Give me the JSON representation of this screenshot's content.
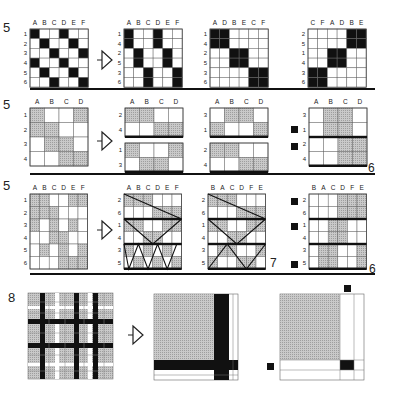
{
  "colors": {
    "black": "#111111",
    "hatch": "#bdbdbd",
    "hatch_line": "#9a9a9a",
    "grid_line": "#555555",
    "white": "#ffffff"
  },
  "sections": [
    {
      "number": "5",
      "panels": [
        {
          "id": "s1p1",
          "cols": [
            "A",
            "B",
            "C",
            "D",
            "E",
            "F"
          ],
          "rows": [
            "1",
            "2",
            "3",
            "4",
            "5",
            "6"
          ],
          "cells": [
            [
              2,
              0,
              0,
              2,
              0,
              0
            ],
            [
              0,
              2,
              0,
              0,
              2,
              0
            ],
            [
              0,
              0,
              2,
              0,
              0,
              2
            ],
            [
              2,
              0,
              0,
              2,
              0,
              0
            ],
            [
              0,
              2,
              0,
              0,
              2,
              0
            ],
            [
              0,
              0,
              2,
              0,
              0,
              2
            ]
          ]
        },
        {
          "id": "s1p2",
          "cols": [
            "A",
            "B",
            "C",
            "D",
            "E",
            "F"
          ],
          "rows": [
            "1",
            "4",
            "2",
            "5",
            "3",
            "6"
          ],
          "cells": [
            [
              2,
              0,
              0,
              2,
              0,
              0
            ],
            [
              2,
              0,
              0,
              2,
              0,
              0
            ],
            [
              0,
              2,
              0,
              0,
              2,
              0
            ],
            [
              0,
              2,
              0,
              0,
              2,
              0
            ],
            [
              0,
              0,
              2,
              0,
              0,
              2
            ],
            [
              0,
              0,
              2,
              0,
              0,
              2
            ]
          ]
        },
        {
          "id": "s1p3",
          "cols": [
            "A",
            "D",
            "B",
            "E",
            "C",
            "F"
          ],
          "rows": [
            "1",
            "4",
            "2",
            "5",
            "3",
            "6"
          ],
          "cells": [
            [
              2,
              2,
              0,
              0,
              0,
              0
            ],
            [
              2,
              2,
              0,
              0,
              0,
              0
            ],
            [
              0,
              0,
              2,
              2,
              0,
              0
            ],
            [
              0,
              0,
              2,
              2,
              0,
              0
            ],
            [
              0,
              0,
              0,
              0,
              2,
              2
            ],
            [
              0,
              0,
              0,
              0,
              2,
              2
            ]
          ]
        },
        {
          "id": "s1p4",
          "cols": [
            "C",
            "F",
            "A",
            "D",
            "B",
            "E"
          ],
          "rows": [
            "2",
            "5",
            "1",
            "4",
            "3",
            "6"
          ],
          "cells": [
            [
              0,
              0,
              0,
              0,
              2,
              2
            ],
            [
              0,
              0,
              0,
              0,
              2,
              2
            ],
            [
              0,
              0,
              2,
              2,
              0,
              0
            ],
            [
              0,
              0,
              2,
              2,
              0,
              0
            ],
            [
              2,
              2,
              0,
              0,
              0,
              0
            ],
            [
              2,
              2,
              0,
              0,
              0,
              0
            ]
          ]
        }
      ]
    },
    {
      "number": "5",
      "side_number": "6",
      "panels": [
        {
          "id": "s2p1",
          "cols": [
            "A",
            "B",
            "C",
            "D"
          ],
          "rows": [
            "1",
            "2",
            "3",
            "4"
          ],
          "cells": [
            [
              1,
              0,
              0,
              1
            ],
            [
              1,
              1,
              0,
              0
            ],
            [
              0,
              1,
              1,
              0
            ],
            [
              0,
              0,
              1,
              1
            ]
          ]
        },
        {
          "id": "s2p2a",
          "cols": [
            "A",
            "B",
            "C",
            "D"
          ],
          "rows": [
            "2",
            "4"
          ],
          "cells": [
            [
              1,
              1,
              0,
              0
            ],
            [
              0,
              0,
              1,
              1
            ]
          ]
        },
        {
          "id": "s2p2b",
          "cols": [],
          "rows": [
            "1",
            "3"
          ],
          "cells": [
            [
              1,
              0,
              0,
              1
            ],
            [
              0,
              1,
              1,
              0
            ]
          ]
        },
        {
          "id": "s2p3a",
          "cols": [
            "A",
            "B",
            "C",
            "D"
          ],
          "rows": [
            "3",
            "1"
          ],
          "cells": [
            [
              0,
              1,
              1,
              0
            ],
            [
              1,
              0,
              0,
              1
            ]
          ]
        },
        {
          "id": "s2p3b",
          "cols": [],
          "rows": [
            "2",
            "4"
          ],
          "cells": [
            [
              1,
              1,
              0,
              0
            ],
            [
              0,
              0,
              1,
              1
            ]
          ]
        },
        {
          "id": "s2p4",
          "cols": [
            "A",
            "B",
            "C",
            "D"
          ],
          "rows": [
            "3",
            "1",
            "2",
            "4"
          ],
          "cells": [
            [
              0,
              1,
              1,
              0
            ],
            [
              0,
              1,
              1,
              0
            ],
            [
              0,
              0,
              1,
              1
            ],
            [
              0,
              0,
              1,
              1
            ]
          ]
        }
      ]
    },
    {
      "number": "5",
      "side_number_a": "7",
      "side_number_b": "6",
      "panels": [
        {
          "id": "s3p1",
          "cols": [
            "A",
            "B",
            "C",
            "D",
            "E",
            "F"
          ],
          "rows": [
            "1",
            "2",
            "3",
            "4",
            "5",
            "6"
          ],
          "cells": [
            [
              1,
              1,
              0,
              0,
              1,
              1
            ],
            [
              1,
              1,
              1,
              0,
              0,
              0
            ],
            [
              1,
              0,
              1,
              0,
              1,
              0
            ],
            [
              0,
              0,
              1,
              1,
              0,
              0
            ],
            [
              0,
              1,
              0,
              1,
              0,
              1
            ],
            [
              0,
              0,
              0,
              1,
              1,
              1
            ]
          ]
        },
        {
          "id": "s3p2",
          "cols": [
            "A",
            "B",
            "C",
            "D",
            "E",
            "F"
          ],
          "rows": [
            "2",
            "6",
            "1",
            "4",
            "3",
            "5"
          ],
          "cells": [
            [
              1,
              1,
              1,
              0,
              0,
              0
            ],
            [
              0,
              0,
              0,
              1,
              1,
              1
            ],
            [
              1,
              1,
              0,
              0,
              1,
              1
            ],
            [
              0,
              0,
              1,
              1,
              0,
              0
            ],
            [
              1,
              0,
              1,
              0,
              1,
              0
            ],
            [
              0,
              1,
              0,
              1,
              0,
              1
            ]
          ]
        },
        {
          "id": "s3p3",
          "cols": [
            "B",
            "A",
            "C",
            "D",
            "F",
            "E"
          ],
          "rows": [
            "2",
            "6",
            "1",
            "4",
            "3",
            "5"
          ],
          "cells": [
            [
              1,
              1,
              1,
              0,
              0,
              0
            ],
            [
              0,
              0,
              0,
              1,
              1,
              1
            ],
            [
              1,
              1,
              0,
              0,
              1,
              1
            ],
            [
              0,
              0,
              1,
              1,
              0,
              0
            ],
            [
              0,
              1,
              1,
              0,
              0,
              1
            ],
            [
              1,
              0,
              0,
              1,
              1,
              0
            ]
          ]
        },
        {
          "id": "s3p4",
          "cols": [
            "B",
            "A",
            "C",
            "D",
            "F",
            "E"
          ],
          "rows": [
            "2",
            "6",
            "1",
            "4",
            "3",
            "5"
          ],
          "cells": [
            [
              0,
              0,
              0,
              1,
              1,
              1
            ],
            [
              0,
              0,
              0,
              1,
              1,
              1
            ],
            [
              0,
              0,
              1,
              1,
              0,
              0
            ],
            [
              0,
              0,
              1,
              1,
              0,
              0
            ],
            [
              0,
              1,
              1,
              0,
              0,
              1
            ],
            [
              0,
              1,
              1,
              0,
              0,
              1
            ]
          ]
        }
      ]
    },
    {
      "number": "8",
      "panels": [
        {
          "id": "s4p1",
          "label": "plaid"
        },
        {
          "id": "s4p2",
          "label": "reduced-block"
        },
        {
          "id": "s4p3",
          "label": "reduced-block-marked"
        }
      ]
    }
  ],
  "arrows": [
    "arrow-1",
    "arrow-2",
    "arrow-3",
    "arrow-4"
  ]
}
